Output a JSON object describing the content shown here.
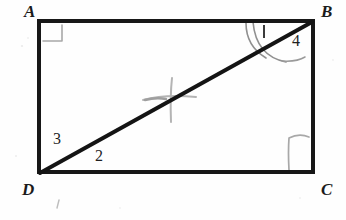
{
  "figure": {
    "kind": "hand-drawn-geometry-diagram",
    "background_color": "#fefefe",
    "ink_color": "#171717",
    "pencil_color": "#9a9a9a",
    "rectangle": {
      "vertices": [
        {
          "name": "A",
          "x": 39,
          "y": 21,
          "label_x": 24,
          "label_y": 4
        },
        {
          "name": "B",
          "x": 313,
          "y": 21,
          "label_x": 320,
          "label_y": 4
        },
        {
          "name": "C",
          "x": 313,
          "y": 172,
          "label_x": 320,
          "label_y": 182
        },
        {
          "name": "D",
          "x": 39,
          "y": 172,
          "label_x": 22,
          "label_y": 182
        }
      ],
      "stroke_width": 4
    },
    "diagonal": {
      "name": "diagonal-DB",
      "from": "D",
      "to": "B",
      "stroke_width": 4
    },
    "angle_labels": [
      {
        "text": "1",
        "x": 262,
        "y": 24,
        "style": "tick"
      },
      {
        "text": "4",
        "x": 292,
        "y": 34,
        "style": "numeral"
      },
      {
        "text": "3",
        "x": 53,
        "y": 132,
        "style": "numeral"
      },
      {
        "text": "2",
        "x": 95,
        "y": 149,
        "style": "numeral"
      }
    ],
    "vertex_labels": [
      {
        "text": "A"
      },
      {
        "text": "B"
      },
      {
        "text": "C"
      },
      {
        "text": "D"
      }
    ],
    "right_angle_marks": [
      {
        "at": "A",
        "size": 19,
        "color": "#a6a6a6"
      },
      {
        "at": "C",
        "size": 22,
        "color": "#a6a6a6"
      }
    ],
    "angle_arcs": [
      {
        "at": "B",
        "note": "large arc from top edge sweeping past diagonal to right side",
        "color": "#8e8e8e"
      }
    ],
    "pencil_marks": {
      "note": "faint cross / plus scribble near center of the diagonal",
      "color": "#b0b0b0"
    }
  }
}
